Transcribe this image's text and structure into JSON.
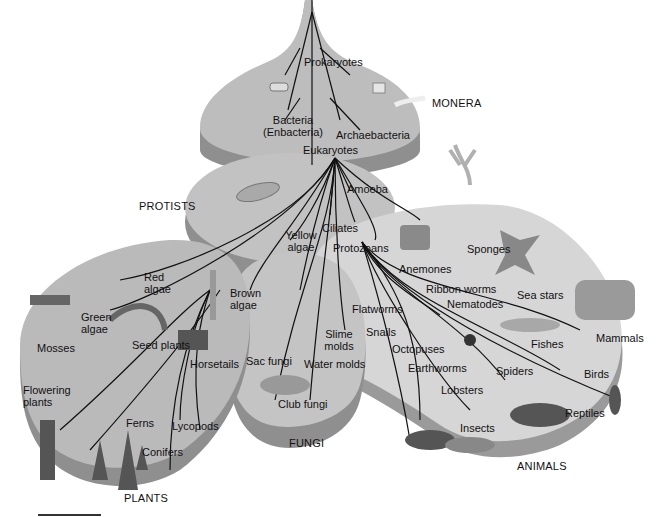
{
  "kingdoms": {
    "monera": "MONERA",
    "protists": "PROTISTS",
    "plants": "PLANTS",
    "fungi": "FUNGI",
    "animals": "ANIMALS"
  },
  "nodes": {
    "prokaryotes": "Prokaryotes",
    "bacteria_1": "Bacteria",
    "bacteria_2": "(Enbacteria)",
    "archaebacteria": "Archaebacteria",
    "eukaryotes": "Eukaryotes",
    "amoeba": "Amoeba",
    "yellow_1": "Yellow",
    "yellow_2": "algae",
    "ciliates": "Ciliates",
    "protozoans": "Protozoans",
    "red_1": "Red",
    "red_2": "algae",
    "brown_1": "Brown",
    "brown_2": "algae",
    "green_1": "Green",
    "green_2": "algae",
    "mosses": "Mosses",
    "seed_plants": "Seed plants",
    "horsetails": "Horsetails",
    "flowering_1": "Flowering",
    "flowering_2": "plants",
    "ferns": "Ferns",
    "lycopods": "Lycopods",
    "conifers": "Conifers",
    "sac_fungi": "Sac fungi",
    "slime_1": "Slime",
    "slime_2": "molds",
    "water_molds": "Water molds",
    "club_fungi": "Club fungi",
    "sponges": "Sponges",
    "anemones": "Anemones",
    "sea_stars": "Sea stars",
    "ribbon_worms": "Ribbon worms",
    "nematodes": "Nematodes",
    "flatworms": "Flatworms",
    "snails": "Snails",
    "octopuses": "Octopuses",
    "earthworms": "Earthworms",
    "lobsters": "Lobsters",
    "spiders": "Spiders",
    "fishes": "Fishes",
    "mammals": "Mammals",
    "birds": "Birds",
    "reptiles": "Reptiles",
    "insects": "Insects"
  },
  "colors": {
    "disc_top": "#bdbdbd",
    "disc_side": "#8f8f8f",
    "animals_top": "#d6d6d6",
    "line": "#111111"
  }
}
